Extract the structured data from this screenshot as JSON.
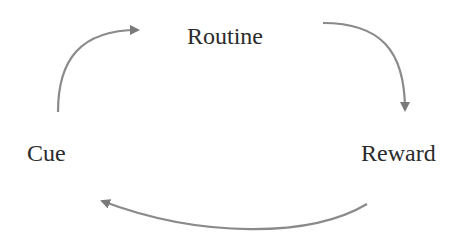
{
  "diagram": {
    "title": "",
    "nodes": [
      {
        "id": "routine",
        "label": "Routine"
      },
      {
        "id": "cue",
        "label": "Cue"
      },
      {
        "id": "reward",
        "label": "Reward"
      }
    ],
    "edges": [
      {
        "from": "cue",
        "to": "routine"
      },
      {
        "from": "routine",
        "to": "reward"
      },
      {
        "from": "reward",
        "to": "cue"
      }
    ],
    "colors": {
      "text": "#2b2b2b",
      "arrow": "#808080"
    }
  }
}
